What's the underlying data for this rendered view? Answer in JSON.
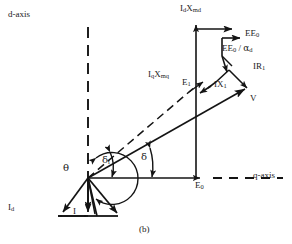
{
  "figure": {
    "caption": "(b)",
    "type": "phasor-diagram",
    "stroke_color": "#141414",
    "background_color": "#ffffff"
  },
  "axes": {
    "d_axis": {
      "label": "d-axis",
      "style": "dashed",
      "orientation": "vertical",
      "x": 88,
      "y_top": 28,
      "y_bottom": 178
    },
    "q_axis": {
      "label": "q-axis",
      "style": "solid-then-dashed",
      "orientation": "horizontal",
      "y": 178,
      "x_start": 88,
      "x_end": 284
    }
  },
  "origin": {
    "x": 88,
    "y": 178
  },
  "angles": [
    {
      "name": "theta",
      "symbol": "θ",
      "label_x": 66,
      "label_y": 166,
      "desc": "power factor angle between I and q-axis"
    },
    {
      "name": "delta_i",
      "symbol": "δ",
      "subscript": "i",
      "label_x": 105,
      "label_y": 158,
      "desc": "internal angle"
    },
    {
      "name": "delta",
      "symbol": "δ",
      "label_x": 144,
      "label_y": 155,
      "desc": "load angle"
    }
  ],
  "vectors": [
    {
      "name": "V",
      "label": "V",
      "label_x": 252,
      "label_y": 96,
      "desc": "terminal voltage phasor from origin",
      "from": [
        88,
        178
      ],
      "to": [
        248,
        88
      ]
    },
    {
      "name": "E0",
      "label": "E",
      "subscript": "0",
      "label_x": 205,
      "label_y": 183,
      "desc": "E0 along q-axis"
    },
    {
      "name": "E1",
      "label": "E",
      "subscript": "1",
      "label_x": 186,
      "label_y": 80,
      "desc": "E1 air-gap emf"
    },
    {
      "name": "IR1",
      "label": "IR",
      "subscript": "1",
      "label_x": 256,
      "label_y": 66,
      "desc": "stator resistance drop"
    },
    {
      "name": "IX1",
      "label": "IX",
      "subscript": "1",
      "label_x": 220,
      "label_y": 82,
      "desc": "leakage reactance drop"
    },
    {
      "name": "Id",
      "label": "I",
      "subscript": "d",
      "label_x": 11,
      "label_y": 207,
      "desc": "direct axis current"
    },
    {
      "name": "I",
      "label": "I",
      "label_x": 70,
      "label_y": 212,
      "desc": "armature current phasor"
    },
    {
      "name": "IqXmq",
      "label": "I",
      "subscript": "q",
      "label2": "X",
      "subscript2": "mq",
      "label_x": 154,
      "label_y": 74,
      "desc": "q-axis magnetizing reactance drop"
    },
    {
      "name": "IdXmd",
      "label": "I",
      "subscript": "d",
      "label2": "X",
      "subscript2": "md",
      "label_x": 182,
      "label_y": 9,
      "desc": "d-axis magnetizing reactance drop"
    },
    {
      "name": "EE0",
      "label": "EE",
      "subscript": "0",
      "label_x": 250,
      "label_y": 25,
      "desc": "excitation emf"
    },
    {
      "name": "EE0_alpha_d",
      "label": "EE",
      "subscript": "0",
      "divider": " / ",
      "label2": "α",
      "subscript3": "d",
      "label_x": 228,
      "label_y": 42,
      "desc": "excitation emf divided by alpha d"
    }
  ],
  "labels": {
    "d_axis": "d-axis",
    "q_axis": "q-axis",
    "theta": "θ",
    "delta": "δ",
    "delta_i_base": "δ",
    "delta_i_sub": "i",
    "V": "V",
    "E_base": "E",
    "E0_sub": "0",
    "E1_sub": "1",
    "IR_base": "IR",
    "IR1_sub": "1",
    "IX_base": "IX",
    "IX1_sub": "1",
    "I": "I",
    "Id_sub": "d",
    "Iq_sub": "q",
    "X": "X",
    "Xmq_sub": "mq",
    "Xmd_sub": "md",
    "EE_base": "EE",
    "EE0_sub": "0",
    "slash": " / ",
    "alpha": "α",
    "alpha_d_sub": "d",
    "caption": "(b)"
  }
}
